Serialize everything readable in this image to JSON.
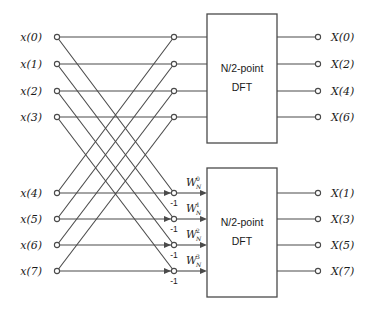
{
  "diagram": {
    "colors": {
      "background": "#ffffff",
      "line": "#4a4a4a",
      "text": "#1a1a1a",
      "node_fill": "#ffffff"
    },
    "inputs": [
      {
        "label": "x(0)"
      },
      {
        "label": "x(1)"
      },
      {
        "label": "x(2)"
      },
      {
        "label": "x(3)"
      },
      {
        "label": "x(4)"
      },
      {
        "label": "x(5)"
      },
      {
        "label": "x(6)"
      },
      {
        "label": "x(7)"
      }
    ],
    "outputs": [
      {
        "label": "X(0)"
      },
      {
        "label": "X(2)"
      },
      {
        "label": "X(4)"
      },
      {
        "label": "X(6)"
      },
      {
        "label": "X(1)"
      },
      {
        "label": "X(3)"
      },
      {
        "label": "X(5)"
      },
      {
        "label": "X(7)"
      }
    ],
    "blocks": [
      {
        "line1": "N/2-point",
        "line2": "DFT"
      },
      {
        "line1": "N/2-point",
        "line2": "DFT"
      }
    ],
    "twiddles": [
      {
        "base": "W",
        "sup": "0",
        "sub": "N"
      },
      {
        "base": "W",
        "sup": "1",
        "sub": "N"
      },
      {
        "base": "W",
        "sup": "2",
        "sub": "N"
      },
      {
        "base": "W",
        "sup": "3",
        "sub": "N"
      }
    ],
    "negative_ones": [
      {
        "label": "-1"
      },
      {
        "label": "-1"
      },
      {
        "label": "-1"
      },
      {
        "label": "-1"
      }
    ]
  }
}
